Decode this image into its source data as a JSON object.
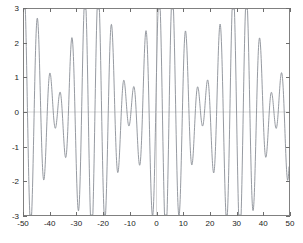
{
  "chart_data": {
    "type": "line",
    "title": "",
    "subtitle": "",
    "xlabel": "",
    "ylabel": "",
    "xlim": [
      -50,
      50
    ],
    "ylim": [
      -3,
      3
    ],
    "grid": true,
    "grid_lines": {
      "x": [
        0
      ],
      "y": [
        0
      ]
    },
    "legend": null,
    "legend_position": "none",
    "xticks": [
      -50,
      -40,
      -30,
      -20,
      -10,
      0,
      10,
      20,
      30,
      40,
      50
    ],
    "xtick_labels": [
      "-50",
      "-40",
      "-30",
      "-20",
      "-10",
      "0",
      "10",
      "20",
      "30",
      "40",
      "50"
    ],
    "yticks": [
      -3,
      -2,
      -1,
      0,
      1,
      2,
      3
    ],
    "ytick_labels": [
      "-3",
      "-2",
      "-1",
      "0",
      "1",
      "2",
      "3"
    ],
    "line_color": "#8a8f96",
    "axis_color": "#808080",
    "background_color": "#ffffff",
    "clipped": true,
    "clip_range": [
      -3,
      3
    ],
    "series": [
      {
        "name": "signal",
        "formula": "2*sin(1.35*x) + 1.6*sin(1.12*x + 0.8)",
        "x_start": -50,
        "x_end": 50,
        "n_points": 1400
      }
    ]
  },
  "axes": {
    "x_axis_name": "x-axis",
    "y_axis_name": "y-axis"
  }
}
